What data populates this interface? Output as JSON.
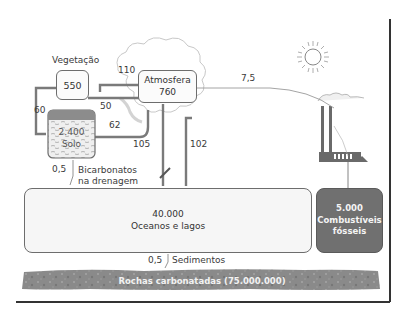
{
  "diagram": {
    "reservoirs": {
      "vegetation": {
        "title": "Vegetação",
        "value": "550"
      },
      "atmosphere": {
        "title": "Atmosfera",
        "value": "760"
      },
      "soil": {
        "value": "2.400",
        "title": "Solo"
      },
      "oceans": {
        "value": "40.000",
        "title": "Oceanos e lagos"
      },
      "fossil_fuels": {
        "value": "5.000",
        "title_line1": "Combustíveis",
        "title_line2": "fósseis"
      },
      "rocks": {
        "label": "Rochas carbonatadas (75.000.000)"
      }
    },
    "fluxes": {
      "atm_to_veg": "110",
      "veg_to_atm": "50",
      "veg_to_soil": "60",
      "soil_to_atm": "62",
      "ocean_to_atm": "105",
      "atm_to_ocean": "102",
      "fossil_to_atm": "7,5",
      "soil_to_ocean_value": "0,5",
      "soil_to_ocean_label_line1": "Bicarbonatos",
      "soil_to_ocean_label_line2": "na drenagem",
      "ocean_to_rock_value": "0,5",
      "ocean_to_rock_label": "Sedimentos"
    },
    "icons": [
      "sun-icon",
      "cloud-icon",
      "factory-icon",
      "fish-icon"
    ],
    "colors": {
      "line": "#6d6d6d",
      "fossil_fill": "#707070",
      "rock_fill": "#8a8a8a",
      "soil_top": "#8c8c8c",
      "frame": "#333333"
    }
  }
}
